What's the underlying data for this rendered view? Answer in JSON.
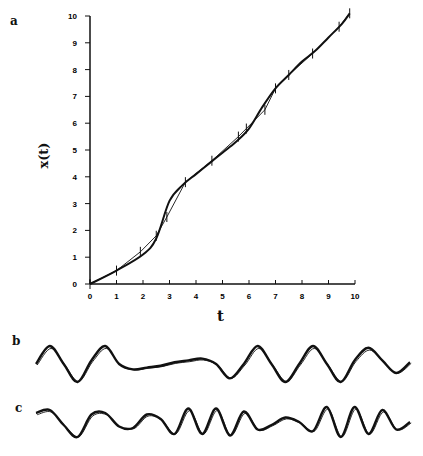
{
  "chart_data": [
    {
      "panel": "a",
      "type": "line",
      "title": "",
      "xlabel": "t",
      "ylabel": "x(t)",
      "xlim": [
        0,
        10
      ],
      "ylim": [
        0,
        10
      ],
      "xticks": [
        "0",
        "1",
        "2",
        "3",
        "4",
        "5",
        "6",
        "7",
        "8",
        "9",
        "10"
      ],
      "yticks": [
        "0",
        "1",
        "2",
        "3",
        "4",
        "5",
        "6",
        "7",
        "8",
        "9",
        "10"
      ],
      "grid": false,
      "series": [
        {
          "name": "x(t) fit",
          "x": [
            0,
            1,
            2,
            2.5,
            3,
            3.5,
            4,
            4.5,
            5,
            5.5,
            6,
            6.5,
            7,
            7.5,
            8,
            8.5,
            9,
            9.5,
            9.8
          ],
          "values": [
            0,
            0.5,
            1.1,
            1.7,
            3.1,
            3.7,
            4.1,
            4.5,
            4.9,
            5.3,
            5.8,
            6.6,
            7.3,
            7.8,
            8.3,
            8.7,
            9.2,
            9.7,
            10.1
          ]
        },
        {
          "name": "x(t) piecewise",
          "x": [
            0,
            1,
            1.9,
            2.5,
            2.9,
            3.6,
            4.6,
            5.6,
            5.9,
            6.6,
            7,
            7.5,
            8.4,
            9.4,
            9.8
          ],
          "values": [
            0,
            0.5,
            1.2,
            1.8,
            2.5,
            3.8,
            4.6,
            5.5,
            5.8,
            6.5,
            7.3,
            7.8,
            8.6,
            9.6,
            10.1
          ]
        }
      ]
    },
    {
      "panel": "b",
      "type": "line",
      "title": "",
      "description": "oscillating waveform, two overlaid traces",
      "series": [
        {
          "name": "b trace",
          "values": [
            0,
            1,
            0,
            -1,
            0.2,
            1,
            0,
            -0.3,
            -0.2,
            -0.1,
            0.1,
            0.2,
            0.3,
            0,
            -0.8,
            0,
            1,
            0,
            -1,
            0,
            1,
            0,
            -1,
            0.2,
            0.9,
            0.2,
            -0.5,
            0.1
          ]
        }
      ]
    },
    {
      "panel": "c",
      "type": "line",
      "title": "",
      "description": "oscillating waveform, two overlaid traces",
      "series": [
        {
          "name": "c trace",
          "values": [
            0.6,
            0.8,
            -0.2,
            -1,
            0.5,
            0.6,
            -0.3,
            -0.4,
            0.5,
            0.2,
            -0.8,
            0.9,
            -0.8,
            0.9,
            -0.9,
            0.7,
            -0.5,
            -0.2,
            0.3,
            0,
            -0.6,
            1,
            -1,
            1,
            -0.8,
            0.8,
            -0.5,
            0
          ]
        }
      ]
    }
  ],
  "labels": {
    "a": "a",
    "b": "b",
    "c": "c",
    "xlabel": "t",
    "ylabel": "x(t)"
  }
}
